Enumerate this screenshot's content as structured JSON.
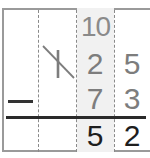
{
  "problem": {
    "operation": "subtraction",
    "operator_symbol": "−",
    "borrow_annotation": "10",
    "crossed_out_digit": "1",
    "minuend": {
      "hundreds": "1",
      "tens": "2",
      "ones": "5"
    },
    "subtrahend": {
      "tens": "7",
      "ones": "3"
    },
    "difference": {
      "tens": "5",
      "ones": "2"
    }
  },
  "colors": {
    "border": "#9a9a9a",
    "dashed_lines": "#8a8a8a",
    "shaded_column": "#f1f1f1",
    "given_digits": "#7d7d7d",
    "result_digits": "#1e1e1e",
    "rule": "#2a2a2a"
  }
}
